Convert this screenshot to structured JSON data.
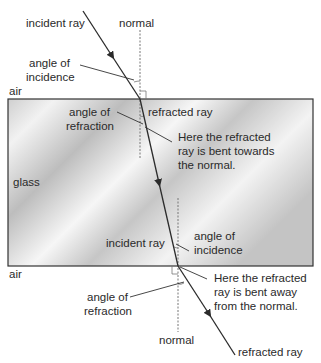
{
  "diagram": {
    "media": {
      "top": "air",
      "middle": "glass",
      "bottom": "air"
    },
    "colors": {
      "ray": "#2b2b2b",
      "normal": "#666666",
      "block_border": "#333333",
      "glass_light": "#f4f4f4",
      "glass_dark": "#bdbdbd"
    },
    "top_interface": {
      "incident_ray": "incident ray",
      "normal": "normal",
      "angle_of_incidence": [
        "angle of",
        "incidence"
      ],
      "refracted_ray": "refracted ray",
      "angle_of_refraction": [
        "angle of",
        "refraction"
      ],
      "note": [
        "Here the refracted",
        "ray is bent towards",
        "the normal."
      ]
    },
    "bottom_interface": {
      "incident_ray": "incident ray",
      "angle_of_incidence": [
        "angle of",
        "incidence"
      ],
      "note": [
        "Here the refracted",
        "ray is bent away",
        "from the normal."
      ],
      "angle_of_refraction": [
        "angle of",
        "refraction"
      ],
      "normal": "normal",
      "refracted_ray": "refracted ray"
    }
  }
}
